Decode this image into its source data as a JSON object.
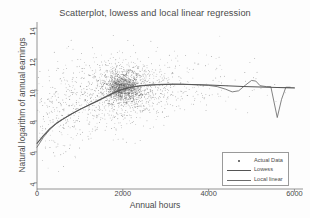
{
  "chart_data": {
    "type": "scatter",
    "title": "Scatterplot, lowess and local linear regression",
    "xlabel": "Annual hours",
    "ylabel": "Natural logarithm of annual earnings",
    "xlim": [
      0,
      6200
    ],
    "ylim": [
      3.6,
      14.4
    ],
    "xticks": [
      0,
      2000,
      4000,
      6000
    ],
    "xtick_labels": [
      "0",
      "2000",
      "4000",
      "6000"
    ],
    "yticks": [
      4,
      6,
      8,
      10,
      12,
      14
    ],
    "ytick_labels": [
      "4",
      "6",
      "8",
      "10",
      "12",
      "14"
    ],
    "grid": false,
    "legend_position": "lower right",
    "marker_color": "#5a5a5a",
    "lowess_color": "#555555",
    "local_linear_color": "#6b6b6b",
    "series": [
      {
        "name": "Actual Data",
        "kind": "scatter",
        "n_points": 2600,
        "description": "Dense grey point cloud; log-earnings rises steeply with hours then plateaus near 10.3; densest mass at 1800-2200 hours around 10.0-10.4; wide vertical spread from 4 to 14; sparse tail beyond 4000 hours.",
        "density_clusters": [
          {
            "x": 2000,
            "y": 10.2,
            "weight": 1.0,
            "sx": 190,
            "sy": 0.45
          },
          {
            "x": 2050,
            "y": 10.1,
            "weight": 0.55,
            "sx": 420,
            "sy": 0.95
          },
          {
            "x": 1500,
            "y": 9.7,
            "weight": 0.3,
            "sx": 600,
            "sy": 1.25
          },
          {
            "x": 900,
            "y": 9.0,
            "weight": 0.17,
            "sx": 520,
            "sy": 1.45
          },
          {
            "x": 2800,
            "y": 10.3,
            "weight": 0.2,
            "sx": 520,
            "sy": 1.05
          },
          {
            "x": 3600,
            "y": 10.3,
            "weight": 0.07,
            "sx": 520,
            "sy": 1.0
          },
          {
            "x": 400,
            "y": 7.8,
            "weight": 0.09,
            "sx": 330,
            "sy": 1.35
          },
          {
            "x": 4800,
            "y": 10.2,
            "weight": 0.025,
            "sx": 600,
            "sy": 0.95
          }
        ]
      },
      {
        "name": "Lowess",
        "kind": "line",
        "x": [
          0,
          150,
          300,
          450,
          600,
          800,
          1000,
          1200,
          1400,
          1600,
          1800,
          2000,
          2200,
          2400,
          2600,
          2800,
          3000,
          3200,
          3400,
          3600,
          3800,
          4000,
          4400,
          4800,
          5200,
          5600,
          6000
        ],
        "y": [
          6.55,
          7.05,
          7.5,
          7.85,
          8.12,
          8.45,
          8.75,
          9.02,
          9.28,
          9.55,
          9.82,
          10.05,
          10.18,
          10.26,
          10.31,
          10.34,
          10.36,
          10.37,
          10.37,
          10.36,
          10.34,
          10.32,
          10.28,
          10.23,
          10.19,
          10.16,
          10.14
        ]
      },
      {
        "name": "Local linear",
        "kind": "line",
        "x": [
          0,
          150,
          300,
          450,
          600,
          800,
          1000,
          1200,
          1400,
          1600,
          1800,
          2000,
          2200,
          2400,
          2600,
          2800,
          3000,
          3200,
          3400,
          3600,
          3800,
          4000,
          4200,
          4400,
          4550,
          4700,
          4850,
          5000,
          5100,
          5200,
          5350,
          5450,
          5600,
          5700,
          5800,
          5900
        ],
        "y": [
          6.3,
          6.95,
          7.45,
          7.82,
          8.1,
          8.44,
          8.74,
          9.02,
          9.3,
          9.58,
          9.86,
          10.08,
          10.2,
          10.28,
          10.33,
          10.36,
          10.38,
          10.38,
          10.37,
          10.35,
          10.33,
          10.3,
          10.22,
          10.05,
          9.88,
          9.95,
          10.3,
          10.62,
          10.58,
          10.28,
          10.22,
          10.22,
          8.22,
          9.4,
          10.18,
          10.18
        ]
      }
    ]
  },
  "legend": {
    "entries": [
      {
        "label": "Actual Data",
        "key": "dot"
      },
      {
        "label": "Lowess",
        "key": "line"
      },
      {
        "label": "Local linear",
        "key": "line"
      }
    ]
  }
}
